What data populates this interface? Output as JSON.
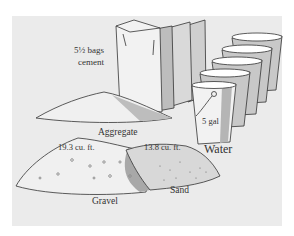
{
  "figure": {
    "background_color": "#ebebeb",
    "ink_color": "#333333",
    "items": {
      "cement": {
        "quantity": "5½ bags",
        "label": "cement"
      },
      "aggregate": {
        "label": "Aggregate"
      },
      "gravel": {
        "volume": "19.3 cu. ft.",
        "label": "Gravel"
      },
      "sand": {
        "volume": "13.8 cu. ft.",
        "label": "Sand"
      },
      "water": {
        "volume": "5 gal",
        "label": "Water",
        "bucket_count": 5
      }
    }
  }
}
